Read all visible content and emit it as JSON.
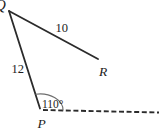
{
  "figure": {
    "type": "geometry-diagram",
    "labels": {
      "vertex_q": "Q",
      "vertex_r": "R",
      "vertex_p": "P",
      "side_qr_length": "10",
      "side_qp_length": "12",
      "angle_at_p": "110°"
    },
    "values": {
      "qr": 10,
      "qp": 12,
      "angle_p_degrees": 110
    },
    "colors": {
      "line": "#2b2b2b",
      "arc": "#6e6e6e",
      "text": "#1c1c1c",
      "background": "#ffffff"
    }
  }
}
